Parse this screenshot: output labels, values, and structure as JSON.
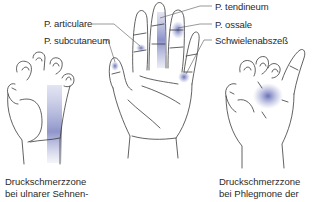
{
  "figure": {
    "labels": {
      "articulare": "P. articulare",
      "subcutaneum": "P. subcutaneum",
      "tendineum": "P. tendineum",
      "ossale": "P. ossale",
      "schwiele": "Schwielenabszeß"
    },
    "captions": {
      "left": {
        "line1": "Druckschmerzzone",
        "line2": "bei ulnarer Sehnen-"
      },
      "right": {
        "line1": "Druckschmerzzone",
        "line2": "bei Phlegmone der"
      }
    },
    "colors": {
      "outline": "#3a3a3a",
      "highlight": "#5a64b4",
      "text": "#2a2a2a"
    }
  }
}
